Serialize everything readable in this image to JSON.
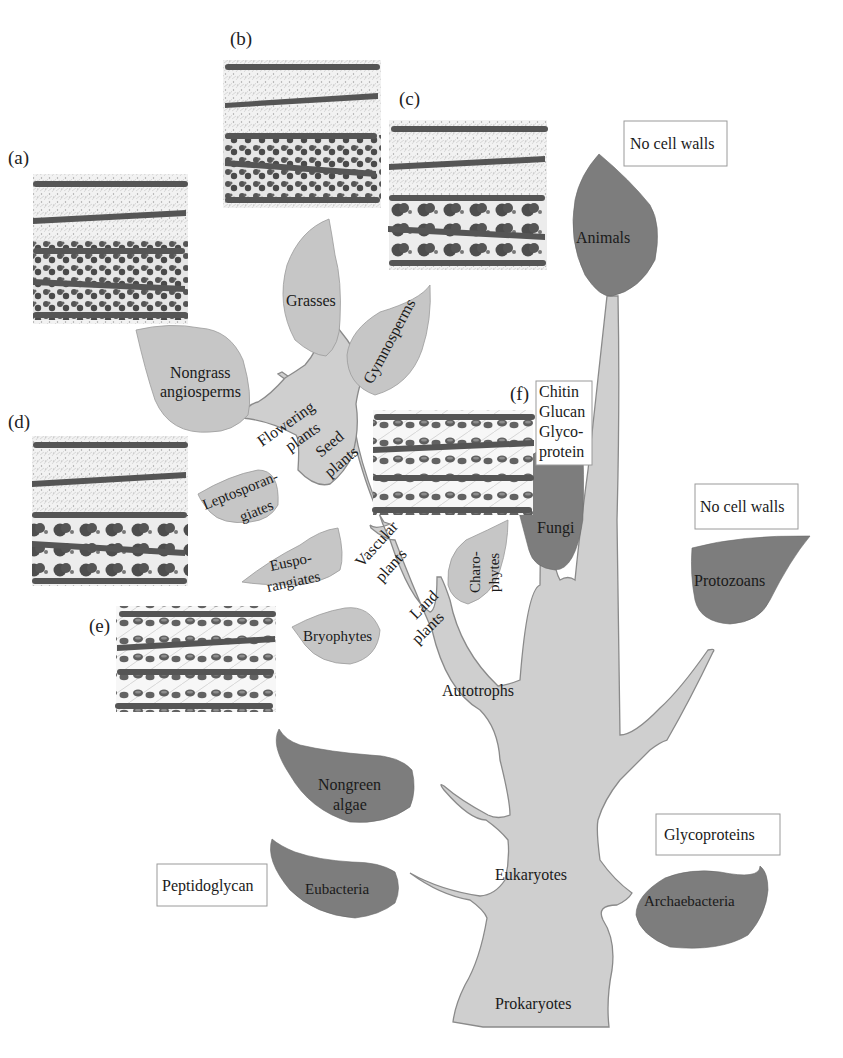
{
  "diagram": {
    "type": "tree-of-life",
    "colors": {
      "trunk_fill": "#cfcfcf",
      "light_leaf": "#c6c6c6",
      "dark_leaf": "#7d7d7d",
      "outline": "#8a8a8a",
      "wall_band": "#5a5a5a",
      "box_border": "#9a9a9a"
    },
    "trunk_labels": {
      "prokaryotes": "Prokaryotes",
      "eukaryotes": "Eukaryotes",
      "autotrophs": "Autotrophs",
      "land_plants_1": "Land",
      "land_plants_2": "plants",
      "vascular_plants_1": "Vascular",
      "vascular_plants_2": "plants",
      "seed_plants_1": "Seed",
      "seed_plants_2": "plants",
      "flowering_plants_1": "Flowering",
      "flowering_plants_2": "plants"
    },
    "leaves": {
      "grasses": "Grasses",
      "nongrass_1": "Nongrass",
      "nongrass_2": "angiosperms",
      "gymnosperms": "Gymnosperms",
      "lepto_1": "Leptosporan-",
      "lepto_2": "giates",
      "euspo_1": "Euspo-",
      "euspo_2": "rangiates",
      "bryophytes": "Bryophytes",
      "charo_1": "Charo-",
      "charo_2": "phytes",
      "fungi": "Fungi",
      "animals": "Animals",
      "protozoans": "Protozoans",
      "nongreen_1": "Nongreen",
      "nongreen_2": "algae",
      "eubacteria": "Eubacteria",
      "archaebacteria": "Archaebacteria"
    },
    "boxes": {
      "animals_wall": "No cell walls",
      "protozoans_wall": "No cell walls",
      "fungi_wall_1": "Chitin",
      "fungi_wall_2": "Glucan",
      "fungi_wall_3": "Glyco-",
      "fungi_wall_4": "protein",
      "archaea_wall": "Glycoproteins",
      "eubacteria_wall": "Peptidoglycan"
    },
    "panels": {
      "a": "(a)",
      "b": "(b)",
      "c": "(c)",
      "d": "(d)",
      "e": "(e)",
      "f": "(f)"
    }
  }
}
